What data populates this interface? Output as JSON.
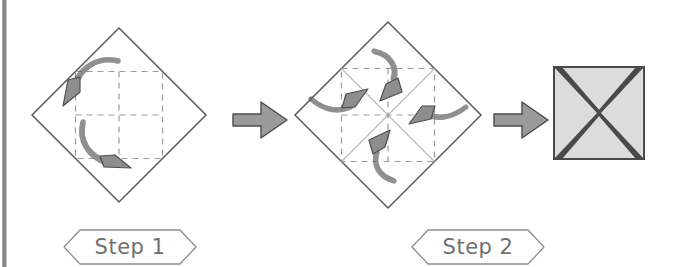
{
  "page": {
    "width": 679,
    "height": 267,
    "background": "#ffffff"
  },
  "colors": {
    "paper_outline": "#5a5a5a",
    "crease_dashed": "#9b9b9b",
    "crease_solid_gray": "#bdbdbd",
    "arrow_fill": "#8e8e8e",
    "arrow_stroke": "#4f4f4f",
    "transition_arrow_fill": "#9a9a9a",
    "transition_arrow_stroke": "#4a4a4a",
    "result_fill": "#dcdcdc",
    "result_stroke": "#4a4a4a",
    "banner_stroke": "#8d8d8d",
    "label_text": "#6f6f6f",
    "scan_stripe": "#8c8c8c"
  },
  "steps": [
    {
      "id": "step-1",
      "label": "Step 1",
      "shape": "diamond",
      "center_x": 119,
      "center_y": 115,
      "half_diagonal": 87,
      "creases": "dashed-square-through-midpoints",
      "arrow_count": 2,
      "arrow_description": "two curved C-shaped fold arrows rotating inward"
    },
    {
      "id": "step-2",
      "label": "Step 2",
      "shape": "diamond",
      "center_x": 388,
      "center_y": 115,
      "half_diagonal": 93,
      "creases": "dashed-square-plus-gray-diagonals",
      "arrow_count": 4,
      "arrow_description": "four curved arrows folding each corner toward the center"
    }
  ],
  "transitions": [
    {
      "id": "transition-arrow-1",
      "direction": "right",
      "x": 231,
      "y": 100
    },
    {
      "id": "transition-arrow-2",
      "direction": "right",
      "x": 492,
      "y": 100
    }
  ],
  "result": {
    "id": "result-square",
    "shape": "square",
    "x": 553,
    "y": 66,
    "size": 92,
    "description": "finished folded square with X-shaped flap seams"
  }
}
